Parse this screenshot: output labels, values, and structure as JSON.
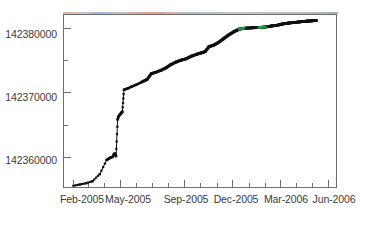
{
  "chart_data": {
    "type": "line",
    "title": "",
    "subtitle": "",
    "xlabel": "",
    "ylabel": "",
    "xlim": [
      "2005-01-15",
      "2006-06-20"
    ],
    "ylim": [
      142355000,
      142382000
    ],
    "grid": false,
    "legend": null,
    "marker": "filled-square",
    "line_colors": {
      "primary": "#111111",
      "highlight": "#1e9e3c",
      "frame": "#6e6e6e",
      "tick_text": "#3a3a3a"
    },
    "y_ticks_major": [
      {
        "value": 142360000,
        "label": "142360000"
      },
      {
        "value": 142370000,
        "label": "142370000"
      },
      {
        "value": 142380000,
        "label": "142380000"
      }
    ],
    "y_ticks_minor": [
      142365000,
      142375000
    ],
    "x_ticks_major": [
      {
        "value": "2005-02",
        "label": "Feb-2005"
      },
      {
        "value": "2005-05",
        "label": "May-2005"
      },
      {
        "value": "2005-09",
        "label": "Sep-2005"
      },
      {
        "value": "2005-12",
        "label": "Dec-2005"
      },
      {
        "value": "2006-03",
        "label": "Mar-2006"
      },
      {
        "value": "2006-06",
        "label": "Jun-2006"
      }
    ],
    "x_ticks_minor": [
      "2005-03",
      "2005-04",
      "2005-06",
      "2005-07",
      "2005-08",
      "2005-10",
      "2005-11",
      "2006-01",
      "2006-02",
      "2006-04",
      "2006-05"
    ],
    "series": [
      {
        "name": "cumulative-count",
        "color": "#111111",
        "points": [
          {
            "x": "2005-02-02",
            "y": 142355500
          },
          {
            "x": "2005-02-14",
            "y": 142355700
          },
          {
            "x": "2005-02-26",
            "y": 142355900
          },
          {
            "x": "2005-03-10",
            "y": 142356200
          },
          {
            "x": "2005-03-24",
            "y": 142357300
          },
          {
            "x": "2005-04-06",
            "y": 142359500
          },
          {
            "x": "2005-04-10",
            "y": 142359700
          },
          {
            "x": "2005-04-14",
            "y": 142359900
          },
          {
            "x": "2005-04-18",
            "y": 142360000
          },
          {
            "x": "2005-04-20",
            "y": 142360400
          },
          {
            "x": "2005-04-22",
            "y": 142360500
          },
          {
            "x": "2005-04-24",
            "y": 142360100
          },
          {
            "x": "2005-04-27",
            "y": 142365800
          },
          {
            "x": "2005-04-29",
            "y": 142366300
          },
          {
            "x": "2005-05-02",
            "y": 142366600
          },
          {
            "x": "2005-05-04",
            "y": 142366800
          },
          {
            "x": "2005-05-06",
            "y": 142367000
          },
          {
            "x": "2005-05-09",
            "y": 142370400
          },
          {
            "x": "2005-05-16",
            "y": 142370600
          },
          {
            "x": "2005-05-24",
            "y": 142370900
          },
          {
            "x": "2005-06-02",
            "y": 142371200
          },
          {
            "x": "2005-06-12",
            "y": 142371600
          },
          {
            "x": "2005-06-22",
            "y": 142372000
          },
          {
            "x": "2005-06-30",
            "y": 142372900
          },
          {
            "x": "2005-07-08",
            "y": 142373100
          },
          {
            "x": "2005-07-18",
            "y": 142373400
          },
          {
            "x": "2005-07-28",
            "y": 142373800
          },
          {
            "x": "2005-08-06",
            "y": 142374300
          },
          {
            "x": "2005-08-16",
            "y": 142374700
          },
          {
            "x": "2005-08-26",
            "y": 142375000
          },
          {
            "x": "2005-09-04",
            "y": 142375200
          },
          {
            "x": "2005-09-14",
            "y": 142375600
          },
          {
            "x": "2005-09-24",
            "y": 142375900
          },
          {
            "x": "2005-10-02",
            "y": 142376100
          },
          {
            "x": "2005-10-10",
            "y": 142376300
          },
          {
            "x": "2005-10-18",
            "y": 142377100
          },
          {
            "x": "2005-10-26",
            "y": 142377300
          },
          {
            "x": "2005-11-04",
            "y": 142377700
          },
          {
            "x": "2005-11-14",
            "y": 142378300
          },
          {
            "x": "2005-11-24",
            "y": 142378900
          },
          {
            "x": "2005-12-04",
            "y": 142379400
          },
          {
            "x": "2005-12-14",
            "y": 142379800
          },
          {
            "x": "2005-12-24",
            "y": 142379950
          },
          {
            "x": "2006-01-06",
            "y": 142380000
          },
          {
            "x": "2006-01-20",
            "y": 142380050
          },
          {
            "x": "2006-02-02",
            "y": 142380150
          },
          {
            "x": "2006-02-14",
            "y": 142380300
          },
          {
            "x": "2006-02-24",
            "y": 142380400
          },
          {
            "x": "2006-03-06",
            "y": 142380600
          },
          {
            "x": "2006-03-18",
            "y": 142380750
          },
          {
            "x": "2006-03-30",
            "y": 142380850
          },
          {
            "x": "2006-04-10",
            "y": 142380950
          },
          {
            "x": "2006-04-22",
            "y": 142381050
          },
          {
            "x": "2006-05-02",
            "y": 142381100
          },
          {
            "x": "2006-05-10",
            "y": 142381150
          }
        ]
      }
    ],
    "highlight_segments": [
      {
        "from": "2005-12-06",
        "to": "2005-12-30",
        "color": "#1e9e3c"
      },
      {
        "from": "2006-01-08",
        "to": "2006-02-10",
        "color": "#1e9e3c"
      }
    ]
  }
}
